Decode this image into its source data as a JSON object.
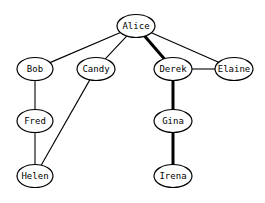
{
  "graph": {
    "nodes": [
      {
        "id": "alice",
        "label": "Alice",
        "x": 136,
        "y": 26,
        "rx": 19,
        "ry": 11.5
      },
      {
        "id": "bob",
        "label": "Bob",
        "x": 35,
        "y": 69,
        "rx": 18,
        "ry": 11.5
      },
      {
        "id": "candy",
        "label": "Candy",
        "x": 96,
        "y": 69,
        "rx": 19,
        "ry": 11.5
      },
      {
        "id": "derek",
        "label": "Derek",
        "x": 173,
        "y": 69,
        "rx": 19,
        "ry": 11.5
      },
      {
        "id": "elaine",
        "label": "Elaine",
        "x": 234,
        "y": 69,
        "rx": 19,
        "ry": 11.5
      },
      {
        "id": "fred",
        "label": "Fred",
        "x": 35,
        "y": 121,
        "rx": 18,
        "ry": 11.5
      },
      {
        "id": "gina",
        "label": "Gina",
        "x": 173,
        "y": 121,
        "rx": 19,
        "ry": 11.5
      },
      {
        "id": "helen",
        "label": "Helen",
        "x": 35,
        "y": 176,
        "rx": 18,
        "ry": 11.5
      },
      {
        "id": "irena",
        "label": "Irena",
        "x": 173,
        "y": 176,
        "rx": 19,
        "ry": 11.5
      }
    ],
    "edges": [
      {
        "from": "alice",
        "to": "bob",
        "bold": false
      },
      {
        "from": "alice",
        "to": "candy",
        "bold": false
      },
      {
        "from": "alice",
        "to": "derek",
        "bold": true
      },
      {
        "from": "alice",
        "to": "elaine",
        "bold": false
      },
      {
        "from": "derek",
        "to": "elaine",
        "bold": false
      },
      {
        "from": "bob",
        "to": "fred",
        "bold": false
      },
      {
        "from": "fred",
        "to": "helen",
        "bold": false
      },
      {
        "from": "candy",
        "to": "helen",
        "bold": false
      },
      {
        "from": "derek",
        "to": "gina",
        "bold": true
      },
      {
        "from": "gina",
        "to": "irena",
        "bold": true
      }
    ]
  }
}
